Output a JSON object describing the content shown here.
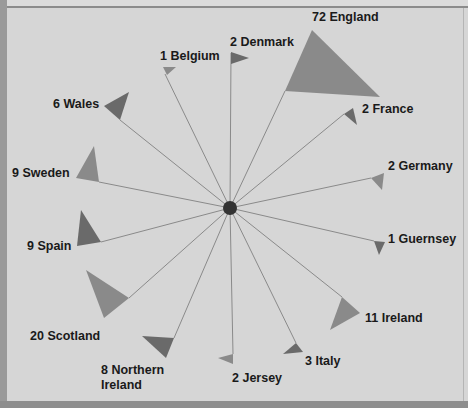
{
  "chart_data": {
    "type": "radial-flag",
    "title": "",
    "center": [
      230,
      208
    ],
    "hub_color": "#333333",
    "spoke_color": "#8a8a8a",
    "colors": {
      "light": "#8a8a8a",
      "dark": "#6a6a6a"
    },
    "categories": [
      "England",
      "France",
      "Germany",
      "Guernsey",
      "Ireland",
      "Italy",
      "Jersey",
      "Northern Ireland",
      "Scotland",
      "Spain",
      "Sweden",
      "Wales",
      "Belgium",
      "Denmark"
    ],
    "values": [
      72,
      2,
      2,
      1,
      11,
      3,
      2,
      8,
      20,
      9,
      9,
      6,
      1,
      2
    ],
    "items": [
      {
        "name": "England",
        "value": 72,
        "label": "72 England",
        "anchor": [
          285,
          91
        ],
        "triangle": [
          [
            312,
            30
          ],
          [
            285,
            91
          ],
          [
            380,
            97
          ]
        ],
        "shade": "light",
        "label_pos": [
          312,
          10
        ]
      },
      {
        "name": "France",
        "value": 2,
        "label": "2 France",
        "anchor": [
          344,
          114
        ],
        "triangle": [
          [
            344,
            114
          ],
          [
            353,
            108
          ],
          [
            357,
            125
          ]
        ],
        "shade": "dark",
        "label_pos": [
          362,
          102
        ]
      },
      {
        "name": "Germany",
        "value": 2,
        "label": "2 Germany",
        "anchor": [
          371,
          178
        ],
        "triangle": [
          [
            371,
            178
          ],
          [
            384,
            173
          ],
          [
            382,
            190
          ]
        ],
        "shade": "light",
        "label_pos": [
          388,
          159
        ]
      },
      {
        "name": "Guernsey",
        "value": 1,
        "label": "1 Guernsey",
        "anchor": [
          374,
          241
        ],
        "triangle": [
          [
            374,
            241
          ],
          [
            385,
            242
          ],
          [
            379,
            255
          ]
        ],
        "shade": "dark",
        "label_pos": [
          388,
          232
        ]
      },
      {
        "name": "Ireland",
        "value": 11,
        "label": "11 Ireland",
        "anchor": [
          342,
          297
        ],
        "triangle": [
          [
            342,
            297
          ],
          [
            360,
            313
          ],
          [
            330,
            330
          ]
        ],
        "shade": "light",
        "label_pos": [
          365,
          311
        ]
      },
      {
        "name": "Italy",
        "value": 3,
        "label": "3 Italy",
        "anchor": [
          296,
          343
        ],
        "triangle": [
          [
            283,
            354
          ],
          [
            296,
            343
          ],
          [
            303,
            352
          ]
        ],
        "shade": "dark",
        "label_pos": [
          305,
          354
        ]
      },
      {
        "name": "Jersey",
        "value": 2,
        "label": "2 Jersey",
        "anchor": [
          233,
          354
        ],
        "triangle": [
          [
            218,
            358
          ],
          [
            233,
            354
          ],
          [
            233,
            364
          ]
        ],
        "shade": "light",
        "label_pos": [
          232,
          371
        ]
      },
      {
        "name": "Northern Ireland",
        "value": 8,
        "label": "8 Northern Ireland",
        "label_lines": [
          "8 Northern",
          "Ireland"
        ],
        "anchor": [
          174,
          338
        ],
        "triangle": [
          [
            142,
            336
          ],
          [
            174,
            338
          ],
          [
            166,
            358
          ]
        ],
        "shade": "dark",
        "label_pos": [
          101,
          363
        ]
      },
      {
        "name": "Scotland",
        "value": 20,
        "label": "20 Scotland",
        "anchor": [
          129,
          298
        ],
        "triangle": [
          [
            86,
            270
          ],
          [
            129,
            298
          ],
          [
            104,
            318
          ]
        ],
        "shade": "light",
        "label_pos": [
          30,
          329
        ]
      },
      {
        "name": "Spain",
        "value": 9,
        "label": "9 Spain",
        "anchor": [
          101,
          242
        ],
        "triangle": [
          [
            81,
            210
          ],
          [
            77,
            246
          ],
          [
            101,
            242
          ]
        ],
        "shade": "dark",
        "label_pos": [
          27,
          239
        ]
      },
      {
        "name": "Sweden",
        "value": 9,
        "label": "9 Sweden",
        "anchor": [
          99,
          182
        ],
        "triangle": [
          [
            94,
            146
          ],
          [
            76,
            178
          ],
          [
            99,
            182
          ]
        ],
        "shade": "light",
        "label_pos": [
          12,
          166
        ]
      },
      {
        "name": "Wales",
        "value": 6,
        "label": "6 Wales",
        "anchor": [
          120,
          120
        ],
        "triangle": [
          [
            129,
            92
          ],
          [
            104,
            106
          ],
          [
            120,
            120
          ]
        ],
        "shade": "dark",
        "label_pos": [
          53,
          97
        ]
      },
      {
        "name": "Belgium",
        "value": 1,
        "label": "1 Belgium",
        "anchor": [
          165,
          74
        ],
        "triangle": [
          [
            163,
            67
          ],
          [
            176,
            67
          ],
          [
            167,
            75
          ]
        ],
        "shade": "light",
        "label_pos": [
          160,
          49
        ]
      },
      {
        "name": "Denmark",
        "value": 2,
        "label": "2 Denmark",
        "anchor": [
          231,
          53
        ],
        "triangle": [
          [
            231,
            52
          ],
          [
            249,
            58
          ],
          [
            231,
            64
          ]
        ],
        "shade": "dark",
        "label_pos": [
          230,
          35
        ]
      }
    ],
    "xlabel": "",
    "ylabel": "",
    "grid": false,
    "legend": "none"
  }
}
